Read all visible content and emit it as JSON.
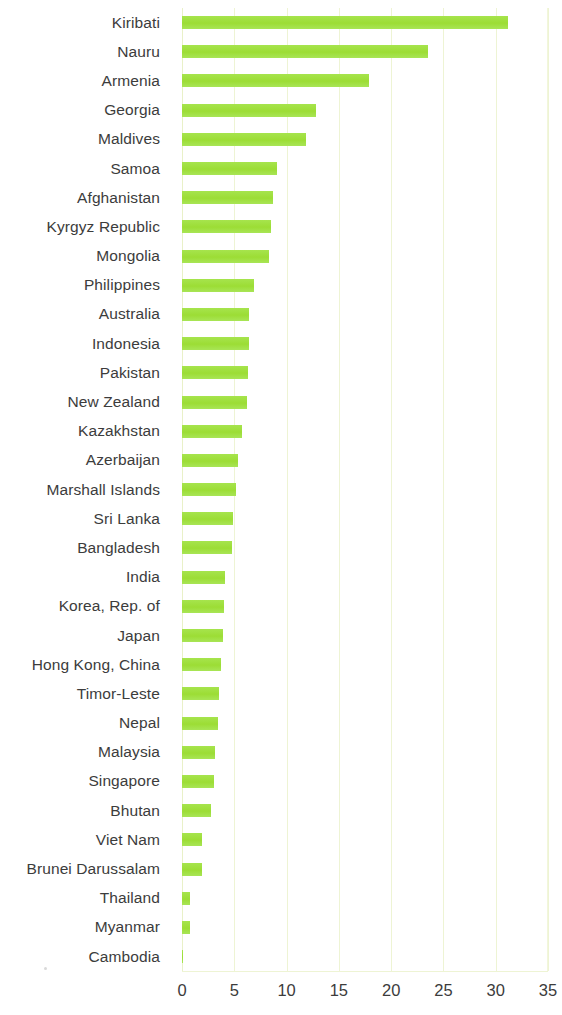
{
  "chart_data": {
    "type": "bar",
    "orientation": "horizontal",
    "title": "",
    "subtitle": "",
    "xlabel": "",
    "ylabel": "",
    "xlim": [
      0,
      35
    ],
    "xticks": [
      0,
      5,
      10,
      15,
      20,
      25,
      30,
      35
    ],
    "xtick_labels": [
      "0",
      "5",
      "10",
      "15",
      "20",
      "25",
      "30",
      "35"
    ],
    "grid": true,
    "legend": null,
    "bar_color": "#9fe03e",
    "text_color": "#3c3c3c",
    "gridline_color": "#eef4d4",
    "categories": [
      "Kiribati",
      "Nauru",
      "Armenia",
      "Georgia",
      "Maldives",
      "Samoa",
      "Afghanistan",
      "Kyrgyz Republic",
      "Mongolia",
      "Philippines",
      "Australia",
      "Indonesia",
      "Pakistan",
      "New Zealand",
      "Kazakhstan",
      "Azerbaijan",
      "Marshall Islands",
      "Sri Lanka",
      "Bangladesh",
      "India",
      "Korea, Rep. of",
      "Japan",
      "Hong Kong, China",
      "Timor-Leste",
      "Nepal",
      "Malaysia",
      "Singapore",
      "Bhutan",
      "Viet Nam",
      "Brunei Darussalam",
      "Thailand",
      "Myanmar",
      "Cambodia"
    ],
    "values": [
      31.2,
      23.5,
      17.9,
      12.8,
      11.9,
      9.1,
      8.7,
      8.5,
      8.3,
      6.9,
      6.4,
      6.4,
      6.3,
      6.2,
      5.7,
      5.4,
      5.2,
      4.9,
      4.8,
      4.1,
      4.0,
      3.9,
      3.7,
      3.5,
      3.4,
      3.2,
      3.1,
      2.8,
      1.9,
      1.9,
      0.8,
      0.8,
      0.05
    ]
  }
}
